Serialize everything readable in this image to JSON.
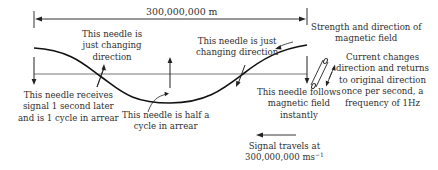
{
  "dimension": {
    "label": "300,000,000 m"
  },
  "labels": {
    "needle_top_left": [
      "This needle is",
      "just changing",
      "direction"
    ],
    "needle_top_right": [
      "This needle is just",
      "changing direction"
    ],
    "field_strength": [
      "Strength and direction of",
      "magnetic field"
    ],
    "current_changes": [
      "Current changes",
      "direction and returns",
      "to original direction",
      "once per second, a",
      "frequency of 1Hz"
    ],
    "needle_left": [
      "This needle receives",
      "signal 1 second later",
      "and is 1 cycle in arrear"
    ],
    "needle_half": [
      "This needle is half a",
      "cycle in arrear"
    ],
    "needle_follows": [
      "This needle follows",
      "magnetic field",
      "instantly"
    ],
    "signal_travels": {
      "line1": "Signal travels at",
      "line2_value": "300,000,000 ms",
      "line2_exponent": "−1"
    }
  },
  "colors": {
    "ink": "#1a1a1a",
    "axis": "#555555",
    "text": "#2f2f2f"
  }
}
